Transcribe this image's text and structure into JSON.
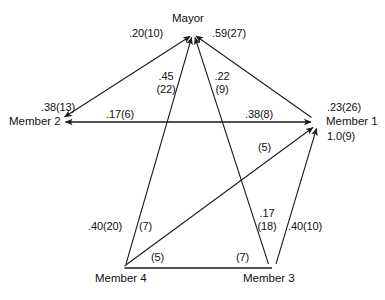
{
  "diagram": {
    "type": "directed-network-sociogram",
    "nodes": [
      {
        "id": "mayor",
        "label": "Mayor",
        "x": 193,
        "y": 33
      },
      {
        "id": "member1",
        "label": "Member 1",
        "x": 318,
        "y": 122
      },
      {
        "id": "member2",
        "label": "Member 2",
        "x": 56,
        "y": 122
      },
      {
        "id": "member3",
        "label": "Member 3",
        "x": 272,
        "y": 268
      },
      {
        "id": "member4",
        "label": "Member 4",
        "x": 124,
        "y": 268
      }
    ],
    "node_stats": {
      "member2_value": ".38(13)",
      "member1_value_1": ".23(26)",
      "member1_value_2": "1.0(9)"
    },
    "edge_labels": {
      "m2_to_mayor": ".20(10)",
      "m1_to_mayor": ".59(27)",
      "m4_to_mayor_line1": ".45",
      "m4_to_mayor_line2": "(22)",
      "m3_to_mayor_line1": ".22",
      "m3_to_mayor_line2": "(9)",
      "m1_to_m2": ".17(6)",
      "m2_to_m1": ".38(8)",
      "m4_to_m1": "(5)",
      "m3_to_m1_line1": ".17",
      "m3_to_m1_line2": "(18)",
      "m3_right": ".40(10)",
      "m4_left": ".40(20)",
      "m4_inner": "(7)",
      "bottom_left": "(5)",
      "bottom_right": "(7)"
    },
    "colors": {
      "line": "#1a1a1a",
      "text": "#111111",
      "background": "#ffffff"
    }
  }
}
